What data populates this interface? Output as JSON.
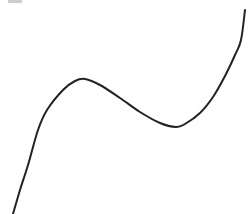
{
  "chart_data": {
    "type": "line",
    "title": "",
    "xlabel": "",
    "ylabel": "",
    "grid": false,
    "axes_visible": false,
    "legend": [],
    "series": [
      {
        "name": "curve",
        "color": "#222222",
        "stroke_width": 2,
        "points_px": [
          [
            13,
            214
          ],
          [
            20,
            190
          ],
          [
            28,
            165
          ],
          [
            38,
            130
          ],
          [
            47,
            110
          ],
          [
            63,
            90
          ],
          [
            75,
            81
          ],
          [
            85,
            79
          ],
          [
            100,
            85
          ],
          [
            120,
            98
          ],
          [
            140,
            112
          ],
          [
            160,
            123
          ],
          [
            176,
            127
          ],
          [
            185,
            124
          ],
          [
            200,
            113
          ],
          [
            213,
            97
          ],
          [
            225,
            76
          ],
          [
            235,
            55
          ],
          [
            241,
            40
          ],
          [
            245,
            10
          ]
        ]
      }
    ],
    "key_points": {
      "local_max": [
        85,
        79
      ],
      "local_min": [
        176,
        127
      ]
    }
  },
  "canvas": {
    "width": 248,
    "height": 214,
    "background": "#ffffff"
  }
}
